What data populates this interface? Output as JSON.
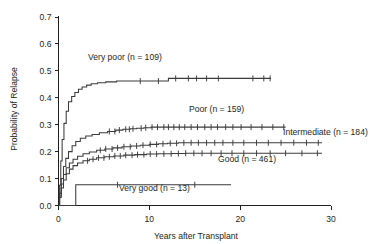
{
  "chart_data": {
    "type": "line",
    "title": "",
    "xlabel": "Years after Transplant",
    "ylabel": "Probability of Relapse",
    "xlim": [
      0,
      30
    ],
    "ylim": [
      0.0,
      0.7
    ],
    "xticks": [
      0,
      10,
      20,
      30
    ],
    "xticklabels": [
      "0",
      "10",
      "20",
      "30"
    ],
    "yticks": [
      0.0,
      0.1,
      0.2,
      0.3,
      0.4,
      0.5,
      0.6,
      0.7
    ],
    "yticklabels": [
      "0.0",
      "0.1",
      "0.2",
      "0.3",
      "0.4",
      "0.5",
      "0.6",
      "0.7"
    ],
    "grid": false,
    "legend_position": "inline-annotations",
    "line_color": "#3b3b3b",
    "axis_color": "#231f20",
    "series": [
      {
        "name": "Very poor",
        "n": 109,
        "label": "Very poor (n = 109)",
        "x": [
          0,
          0.1,
          0.25,
          0.4,
          0.6,
          0.85,
          1.1,
          1.45,
          1.8,
          2.2,
          2.6,
          3.1,
          3.6,
          4.3,
          5.2,
          6.4,
          9.0,
          11.6,
          12.1,
          12.6,
          23.4
        ],
        "y": [
          0.0,
          0.075,
          0.165,
          0.245,
          0.305,
          0.35,
          0.385,
          0.405,
          0.42,
          0.432,
          0.44,
          0.447,
          0.452,
          0.456,
          0.459,
          0.462,
          0.462,
          0.462,
          0.472,
          0.472,
          0.472
        ],
        "censor_x": [
          9.0,
          11.0,
          12.9,
          14.3,
          15.2,
          16.3,
          17.6,
          21.4,
          22.6,
          23.3
        ]
      },
      {
        "name": "Poor",
        "n": 159,
        "label": "Poor (n = 159)",
        "x": [
          0,
          0.12,
          0.3,
          0.55,
          0.8,
          1.1,
          1.5,
          1.9,
          2.4,
          3.0,
          3.7,
          4.5,
          5.4,
          6.3,
          7.1,
          7.9,
          8.6,
          9.4,
          10.2,
          25.0
        ],
        "y": [
          0.0,
          0.045,
          0.1,
          0.145,
          0.175,
          0.2,
          0.222,
          0.238,
          0.25,
          0.258,
          0.264,
          0.27,
          0.275,
          0.28,
          0.283,
          0.285,
          0.287,
          0.289,
          0.291,
          0.291
        ],
        "censor_x": [
          5.6,
          6.2,
          6.7,
          7.4,
          7.8,
          8.2,
          9.1,
          9.6,
          10.3,
          10.9,
          11.6,
          12.1,
          12.7,
          13.3,
          13.9,
          14.6,
          15.3,
          16.1,
          16.8,
          17.5,
          18.4,
          19.2,
          20.1,
          21.2,
          22.4,
          23.6,
          24.8
        ]
      },
      {
        "name": "Intermediate",
        "n": 184,
        "label": "Intermediate (n = 184)",
        "x": [
          0,
          0.12,
          0.3,
          0.55,
          0.85,
          1.2,
          1.6,
          2.1,
          2.7,
          3.4,
          4.2,
          5.1,
          6.0,
          7.0,
          8.0,
          9.0,
          10.0,
          11.0,
          12.0,
          13.2,
          29.0
        ],
        "y": [
          0.0,
          0.035,
          0.08,
          0.115,
          0.14,
          0.158,
          0.172,
          0.183,
          0.192,
          0.199,
          0.205,
          0.21,
          0.214,
          0.218,
          0.221,
          0.224,
          0.227,
          0.229,
          0.231,
          0.233,
          0.233
        ],
        "censor_x": [
          4.6,
          5.2,
          5.9,
          6.5,
          7.2,
          7.9,
          8.6,
          9.3,
          10.1,
          10.8,
          11.5,
          12.3,
          13.0,
          13.8,
          14.6,
          15.4,
          16.3,
          17.2,
          18.1,
          19.2,
          20.4,
          21.8,
          23.1,
          24.5,
          25.9,
          27.3,
          28.6
        ]
      },
      {
        "name": "Good",
        "n": 461,
        "label": "Good (n = 461)",
        "x": [
          0,
          0.12,
          0.3,
          0.55,
          0.85,
          1.2,
          1.6,
          2.1,
          2.7,
          3.4,
          4.2,
          5.1,
          6.1,
          7.2,
          8.4,
          9.7,
          11.0,
          12.5,
          14.0,
          29.0
        ],
        "y": [
          0.0,
          0.03,
          0.065,
          0.095,
          0.118,
          0.135,
          0.148,
          0.158,
          0.166,
          0.172,
          0.177,
          0.181,
          0.184,
          0.187,
          0.189,
          0.191,
          0.192,
          0.193,
          0.194,
          0.194
        ],
        "censor_x": [
          3.2,
          3.8,
          4.4,
          5.0,
          5.6,
          6.2,
          6.8,
          7.4,
          8.1,
          8.7,
          9.4,
          10.1,
          10.8,
          11.6,
          12.4,
          13.2,
          14.0,
          14.9,
          15.8,
          16.8,
          17.9,
          19.1,
          20.4,
          21.8,
          23.3,
          25.0,
          26.8,
          28.5
        ]
      },
      {
        "name": "Very good",
        "n": 13,
        "label": "Very good (n = 13)",
        "x": [
          0,
          0.4,
          1.1,
          1.9,
          19.0
        ],
        "y": [
          0.0,
          0.0,
          0.0,
          0.077,
          0.077
        ],
        "censor_x": [
          6.5,
          15.0
        ]
      }
    ]
  },
  "annotations": {
    "very_poor": "Very poor (n = 109)",
    "poor": "Poor (n = 159)",
    "intermediate": "Intermediate (n = 184)",
    "good": "Good (n = 461)",
    "very_good": "Very good (n = 13)"
  }
}
